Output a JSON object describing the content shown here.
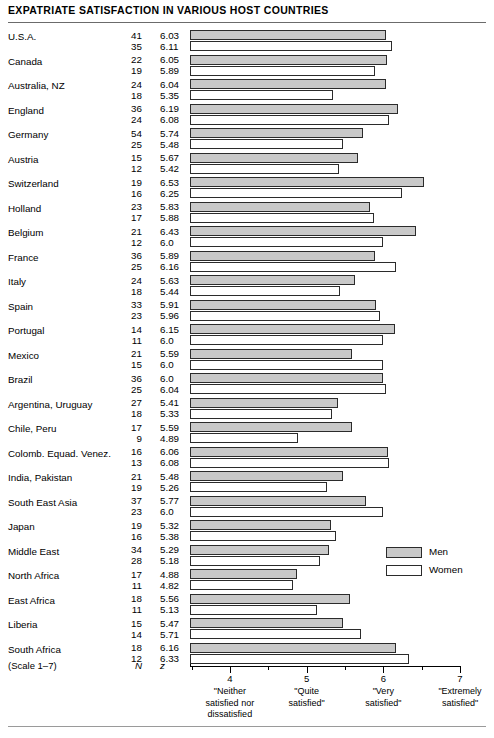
{
  "title": "EXPATRIATE SATISFACTION IN VARIOUS HOST COUNTRIES",
  "columns": {
    "n_header": "N",
    "z_header": "z",
    "scale_note": "(Scale 1–7)"
  },
  "legend": {
    "men": "Men",
    "women": "Women"
  },
  "colors": {
    "men_fill": "#c9c9c9",
    "women_fill": "#ffffff",
    "bar_stroke": "#2b2b2b",
    "rule": "#6b6b6b"
  },
  "chart_data": {
    "type": "bar",
    "orientation": "horizontal",
    "title": "EXPATRIATE SATISFACTION IN VARIOUS HOST COUNTRIES",
    "xlabel": "",
    "ylabel": "",
    "xlim": [
      3.48,
      7.0
    ],
    "axis_start_value": 3.48,
    "grid": false,
    "legend_position": "right-lower",
    "tick_values": [
      4,
      5,
      6,
      7
    ],
    "tick_labels": [
      "4",
      "5",
      "6",
      "7"
    ],
    "minor_tick_values": [
      3.5,
      4.5,
      5.5,
      6.5
    ],
    "anchor_labels": [
      {
        "value": 4,
        "text": "\"Neither satisfied nor dissatisfied\""
      },
      {
        "value": 5,
        "text": "\"Quite satisfied\""
      },
      {
        "value": 6,
        "text": "\"Very satisfied\""
      },
      {
        "value": 7,
        "text": "\"Extremely satisfied\""
      }
    ],
    "anchor_lines": [
      [
        "\"Neither",
        "satisfied nor",
        "dissatisfied"
      ],
      [
        "\"Quite",
        "satisfied\""
      ],
      [
        "\"Very",
        "satisfied\""
      ],
      [
        "\"Extremely",
        "satisfied\""
      ]
    ],
    "categories": [
      "U.S.A.",
      "Canada",
      "Australia, NZ",
      "England",
      "Germany",
      "Austria",
      "Switzerland",
      "Holland",
      "Belgium",
      "France",
      "Italy",
      "Spain",
      "Portugal",
      "Mexico",
      "Brazil",
      "Argentina, Uruguay",
      "Chile, Peru",
      "Colomb. Equad. Venez.",
      "India, Pakistan",
      "South East Asia",
      "Japan",
      "Middle East",
      "North Africa",
      "East Africa",
      "Liberia",
      "South Africa"
    ],
    "series": [
      {
        "name": "Men",
        "values": [
          6.03,
          6.05,
          6.04,
          6.19,
          5.74,
          5.67,
          6.53,
          5.83,
          6.43,
          5.89,
          5.63,
          5.91,
          6.15,
          5.59,
          6.0,
          5.41,
          5.59,
          6.06,
          5.48,
          5.77,
          5.32,
          5.29,
          4.88,
          5.56,
          5.47,
          6.16
        ],
        "n": [
          41,
          22,
          24,
          36,
          54,
          15,
          19,
          23,
          21,
          36,
          24,
          33,
          14,
          21,
          36,
          27,
          17,
          16,
          21,
          37,
          19,
          34,
          17,
          18,
          15,
          18
        ]
      },
      {
        "name": "Women",
        "values": [
          6.11,
          5.89,
          5.35,
          6.08,
          5.48,
          5.42,
          6.25,
          5.88,
          6.0,
          6.16,
          5.44,
          5.96,
          6.0,
          6.0,
          6.04,
          5.33,
          4.89,
          6.08,
          5.26,
          6.0,
          5.38,
          5.18,
          4.82,
          5.13,
          5.71,
          6.33
        ],
        "n": [
          35,
          19,
          18,
          24,
          25,
          12,
          16,
          17,
          12,
          25,
          18,
          23,
          11,
          15,
          25,
          18,
          9,
          13,
          19,
          23,
          16,
          28,
          11,
          11,
          14,
          12
        ]
      }
    ],
    "z_labels": {
      "men": [
        "6.03",
        "6.05",
        "6.04",
        "6.19",
        "5.74",
        "5.67",
        "6.53",
        "5.83",
        "6.43",
        "5.89",
        "5.63",
        "5.91",
        "6.15",
        "5.59",
        "6.0",
        "5.41",
        "5.59",
        "6.06",
        "5.48",
        "5.77",
        "5.32",
        "5.29",
        "4.88",
        "5.56",
        "5.47",
        "6.16"
      ],
      "women": [
        "6.11",
        "5.89",
        "5.35",
        "6.08",
        "5.48",
        "5.42",
        "6.25",
        "5.88",
        "6.0",
        "6.16",
        "5.44",
        "5.96",
        "6.0",
        "6.0",
        "6.04",
        "5.33",
        "4.89",
        "6.08",
        "5.26",
        "6.0",
        "5.38",
        "5.18",
        "4.82",
        "5.13",
        "5.71",
        "6.33"
      ]
    }
  }
}
